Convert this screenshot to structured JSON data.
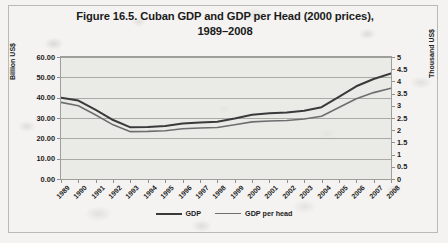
{
  "chart_data": {
    "type": "line",
    "title": "Figure 16.5. Cuban GDP and GDP per Head (2000 prices), 1989–2008",
    "title_line1": "Figure 16.5. Cuban GDP and GDP per Head (2000 prices),",
    "title_line2": "1989–2008",
    "xlabel": "",
    "ylabel": "Billion US$",
    "y2label": "Thousand US$",
    "grid": true,
    "legend_position": "bottom",
    "ylim": [
      0,
      60
    ],
    "y2lim": [
      0,
      5
    ],
    "yticks": [
      "0.00",
      "10.00",
      "20.00",
      "30.00",
      "40.00",
      "50.00",
      "60.00"
    ],
    "y2ticks": [
      "0",
      "0.5",
      "1",
      "1.5",
      "2",
      "2.5",
      "3",
      "3.5",
      "4",
      "4.5",
      "5"
    ],
    "categories": [
      "1989",
      "1990",
      "1991",
      "1992",
      "1993",
      "1994",
      "1995",
      "1996",
      "1997",
      "1998",
      "1999",
      "2000",
      "2001",
      "2002",
      "2003",
      "2004",
      "2005",
      "2006",
      "2007",
      "2008"
    ],
    "series": [
      {
        "name": "GDP",
        "axis": "left",
        "unit": "Billion US$",
        "color": "#3a3a3a",
        "width": 2.0,
        "values": [
          40.0,
          38.6,
          34.0,
          29.0,
          25.4,
          25.6,
          26.1,
          27.3,
          27.8,
          28.2,
          29.8,
          31.6,
          32.3,
          32.7,
          33.6,
          35.3,
          40.4,
          45.6,
          49.2,
          51.9
        ]
      },
      {
        "name": "GDP per head",
        "axis": "right",
        "unit": "Thousand US$",
        "color": "#6e6e6e",
        "width": 1.6,
        "values": [
          3.14,
          3.0,
          2.62,
          2.22,
          1.94,
          1.95,
          1.98,
          2.06,
          2.09,
          2.11,
          2.22,
          2.34,
          2.38,
          2.4,
          2.46,
          2.57,
          2.93,
          3.29,
          3.54,
          3.72
        ]
      }
    ]
  },
  "legend": {
    "items": [
      {
        "label": "GDP"
      },
      {
        "label": "GDP per head"
      }
    ]
  }
}
